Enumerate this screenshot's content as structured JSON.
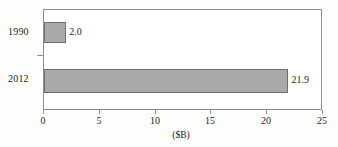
{
  "chart_data": {
    "type": "bar",
    "orientation": "horizontal",
    "title": "",
    "subtitle": "",
    "xlabel": "($B)",
    "ylabel": "",
    "categories": [
      "1990",
      "2012"
    ],
    "values": [
      2.0,
      21.9
    ],
    "data_labels": [
      "2.0",
      "21.9"
    ],
    "xlim": [
      0,
      25
    ],
    "xticks": [
      0,
      5,
      10,
      15,
      20,
      25
    ],
    "xtick_labels": [
      "0",
      "5",
      "10",
      "15",
      "20",
      "25"
    ],
    "grid": false,
    "legend": null,
    "series": [
      {
        "name": "",
        "values": [
          2.0,
          21.9
        ]
      }
    ],
    "colors": {
      "bar_fill": "#a9a9a9",
      "bar_border": "#6f6f6f",
      "frame": "#8e8e8e",
      "text": "#231f20",
      "plot_background": "#ffffff",
      "figure_background": "#fdfdfc"
    }
  }
}
